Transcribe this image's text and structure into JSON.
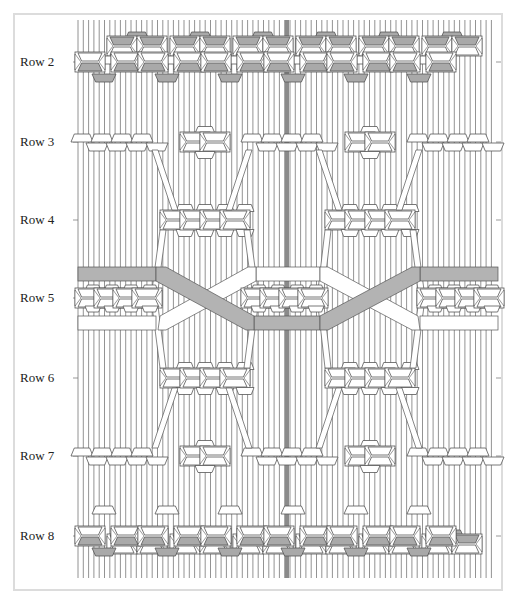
{
  "diagram": {
    "type": "knotting-pattern",
    "rows": [
      {
        "label": "Row 2",
        "y": 62
      },
      {
        "label": "Row 3",
        "y": 142
      },
      {
        "label": "Row 4",
        "y": 220
      },
      {
        "label": "Row 5",
        "y": 298
      },
      {
        "label": "Row 6",
        "y": 378
      },
      {
        "label": "Row 7",
        "y": 456
      },
      {
        "label": "Row 8",
        "y": 536
      }
    ],
    "colors": {
      "cord": "#777777",
      "center_cord": "#8a8a8a",
      "knot_fill": "#ffffff",
      "knot_shaded": "#a9a9a9",
      "band_gray": "#b3b3b3",
      "band_white": "#ffffff",
      "outline": "#555555",
      "frame": "#dcdcdc"
    },
    "bands": [
      {
        "name": "gray-band",
        "color": "gray"
      },
      {
        "name": "white-band",
        "color": "white"
      }
    ]
  }
}
